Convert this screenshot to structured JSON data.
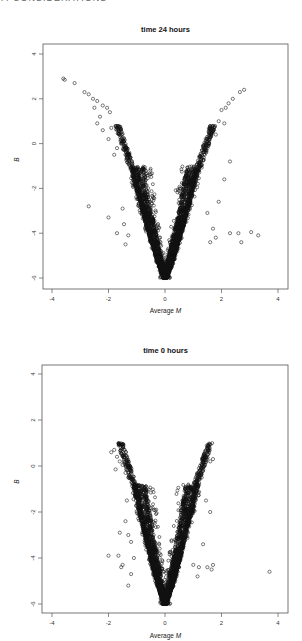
{
  "page": {
    "header": "7. CONSIDERATIONS"
  },
  "chart_data": [
    {
      "type": "scatter",
      "title": "time 24 hours",
      "xlabel_prefix": "Average ",
      "xlabel_var": "M",
      "ylabel": "B",
      "xlim": [
        -4.3,
        4.3
      ],
      "ylim": [
        -6.4,
        4.4
      ],
      "xticks": [
        -4,
        -2,
        0,
        2,
        4
      ],
      "yticks": [
        4,
        2,
        0,
        -2,
        -4,
        -6
      ],
      "grid": false,
      "legend": null,
      "marker": "open-circle",
      "bulk_shape": {
        "description": "dense V-shaped cloud (volcano) with vertex at M=0, B=-6",
        "vertex": [
          0,
          -6
        ],
        "left_arm_top": [
          -1.2,
          -1.0
        ],
        "right_arm_top": [
          1.2,
          -1.0
        ],
        "n_points": 3000
      },
      "outliers": [
        [
          -3.6,
          2.9
        ],
        [
          -3.55,
          2.85
        ],
        [
          -3.2,
          2.7
        ],
        [
          -2.85,
          2.3
        ],
        [
          -2.7,
          2.2
        ],
        [
          -2.55,
          2.0
        ],
        [
          -2.4,
          1.9
        ],
        [
          -2.2,
          1.7
        ],
        [
          -2.05,
          1.6
        ],
        [
          -1.95,
          1.4
        ],
        [
          -2.5,
          1.6
        ],
        [
          -2.3,
          1.2
        ],
        [
          -2.2,
          0.6
        ],
        [
          -2.4,
          0.9
        ],
        [
          -2.0,
          0.2
        ],
        [
          -1.8,
          -0.5
        ],
        [
          -1.7,
          -0.2
        ],
        [
          -1.9,
          0.7
        ],
        [
          1.6,
          0.7
        ],
        [
          1.75,
          0.75
        ],
        [
          2.0,
          1.5
        ],
        [
          2.15,
          1.6
        ],
        [
          2.25,
          1.8
        ],
        [
          2.4,
          2.0
        ],
        [
          2.65,
          2.3
        ],
        [
          2.8,
          2.4
        ],
        [
          1.9,
          1.0
        ],
        [
          1.8,
          0.4
        ],
        [
          2.1,
          0.9
        ],
        [
          -2.7,
          -2.8
        ],
        [
          -2.0,
          -3.3
        ],
        [
          -1.5,
          -2.9
        ],
        [
          -1.3,
          -4.1
        ],
        [
          -1.4,
          -4.5
        ],
        [
          -1.7,
          -4.0
        ],
        [
          -1.45,
          -3.6
        ],
        [
          1.9,
          -2.6
        ],
        [
          2.1,
          -1.6
        ],
        [
          2.3,
          -0.8
        ],
        [
          1.5,
          -3.1
        ],
        [
          1.7,
          -3.8
        ],
        [
          1.8,
          -4.2
        ],
        [
          2.3,
          -4.0
        ],
        [
          2.6,
          -4.0
        ],
        [
          2.7,
          -4.4
        ],
        [
          3.05,
          -3.95
        ],
        [
          3.3,
          -4.1
        ],
        [
          1.6,
          -4.4
        ]
      ]
    },
    {
      "type": "scatter",
      "title": "time 0 hours",
      "xlabel_prefix": "Average ",
      "xlabel_var": "M",
      "ylabel": "B",
      "xlim": [
        -4.3,
        4.3
      ],
      "ylim": [
        -6.4,
        4.4
      ],
      "xticks": [
        -4,
        -2,
        0,
        2,
        4
      ],
      "yticks": [
        4,
        2,
        0,
        -2,
        -4,
        -6
      ],
      "grid": false,
      "legend": null,
      "marker": "open-circle",
      "bulk_shape": {
        "description": "dense V-shaped cloud (volcano) with vertex at M=0, B=-6",
        "vertex": [
          0,
          -6
        ],
        "left_arm_top": [
          -1.1,
          -0.8
        ],
        "right_arm_top": [
          1.15,
          -0.8
        ],
        "n_points": 3000
      },
      "outliers": [
        [
          -1.9,
          0.6
        ],
        [
          -1.8,
          0.7
        ],
        [
          -1.7,
          0.4
        ],
        [
          -1.6,
          0.2
        ],
        [
          -1.5,
          0.05
        ],
        [
          -1.4,
          -0.3
        ],
        [
          -1.3,
          -0.5
        ],
        [
          -1.75,
          -0.15
        ],
        [
          -1.3,
          0.1
        ],
        [
          1.35,
          0.2
        ],
        [
          1.4,
          0.35
        ],
        [
          1.5,
          0.5
        ],
        [
          1.6,
          0.2
        ],
        [
          1.7,
          0.3
        ],
        [
          1.2,
          -0.1
        ],
        [
          1.3,
          -0.5
        ],
        [
          1.45,
          -1.5
        ],
        [
          1.6,
          -2.0
        ],
        [
          1.35,
          -3.4
        ],
        [
          -1.35,
          -1.5
        ],
        [
          -1.4,
          -2.4
        ],
        [
          -1.6,
          -2.9
        ],
        [
          -1.3,
          -3.0
        ],
        [
          -1.2,
          -3.3
        ],
        [
          -2.0,
          -3.9
        ],
        [
          -1.65,
          -3.9
        ],
        [
          -1.5,
          -4.3
        ],
        [
          -1.55,
          -4.4
        ],
        [
          -1.1,
          -4.0
        ],
        [
          -1.2,
          -4.7
        ],
        [
          -1.3,
          -5.2
        ],
        [
          1.0,
          -4.3
        ],
        [
          1.2,
          -4.4
        ],
        [
          1.5,
          -4.4
        ],
        [
          1.7,
          -4.3
        ],
        [
          1.65,
          -4.5
        ],
        [
          1.15,
          -4.8
        ],
        [
          3.7,
          -4.6
        ]
      ]
    }
  ]
}
